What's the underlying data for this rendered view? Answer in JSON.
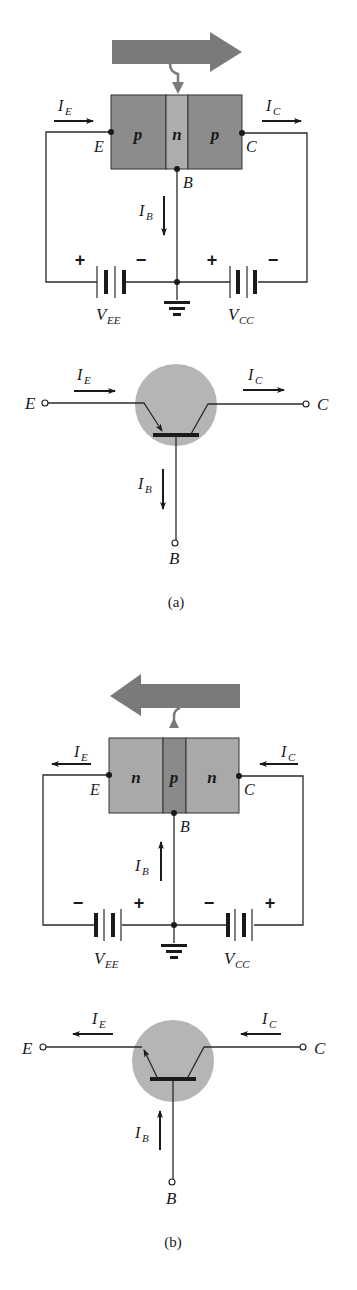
{
  "figure": {
    "panels": [
      {
        "id": "a",
        "caption": "(a)",
        "transistor_type": "pnp",
        "regions": [
          "p",
          "n",
          "p"
        ],
        "terminals": {
          "emitter": "E",
          "base": "B",
          "collector": "C"
        },
        "currents": {
          "emitter": {
            "symbol": "I",
            "sub": "E",
            "direction": "right"
          },
          "collector": {
            "symbol": "I",
            "sub": "C",
            "direction": "right"
          },
          "base": {
            "symbol": "I",
            "sub": "B",
            "direction": "down"
          }
        },
        "sources": [
          {
            "symbol": "V",
            "sub": "EE",
            "left_sign": "+",
            "right_sign": "−"
          },
          {
            "symbol": "V",
            "sub": "CC",
            "left_sign": "+",
            "right_sign": "−"
          }
        ],
        "flow_arrow": "right",
        "symbol_labels": {
          "E": "E",
          "C": "C",
          "B": "B"
        }
      },
      {
        "id": "b",
        "caption": "(b)",
        "transistor_type": "npn",
        "regions": [
          "n",
          "p",
          "n"
        ],
        "terminals": {
          "emitter": "E",
          "base": "B",
          "collector": "C"
        },
        "currents": {
          "emitter": {
            "symbol": "I",
            "sub": "E",
            "direction": "left"
          },
          "collector": {
            "symbol": "I",
            "sub": "C",
            "direction": "left"
          },
          "base": {
            "symbol": "I",
            "sub": "B",
            "direction": "up"
          }
        },
        "sources": [
          {
            "symbol": "V",
            "sub": "EE",
            "left_sign": "−",
            "right_sign": "+"
          },
          {
            "symbol": "V",
            "sub": "CC",
            "left_sign": "−",
            "right_sign": "+"
          }
        ],
        "flow_arrow": "left",
        "symbol_labels": {
          "E": "E",
          "C": "C",
          "B": "B"
        }
      }
    ],
    "colors": {
      "p_region_a": "#8c8c8c",
      "n_region_a": "#adadad",
      "n_region_b": "#a9a9a9",
      "p_region_b": "#8a8a8a",
      "flow_arrow": "#7a7a7a",
      "symbol_circle": "#b5b5b5",
      "ink": "#1a1a1a"
    }
  }
}
